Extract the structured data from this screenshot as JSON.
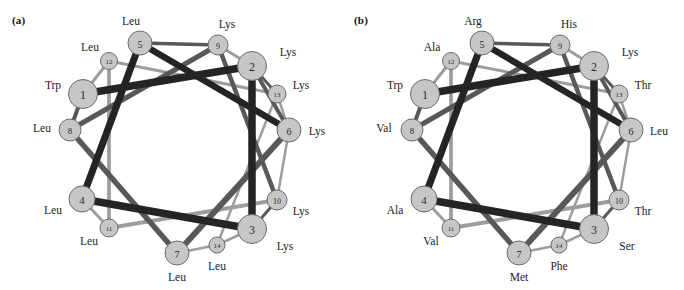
{
  "figure": {
    "type": "helical-wheel-diagram",
    "panels": [
      {
        "id": "a",
        "label": "(a)",
        "label_x": 12,
        "label_y": 14,
        "residues": [
          {
            "num": "1",
            "aa": "Trp",
            "cx": 83,
            "cy": 94,
            "r": 14.5,
            "lx": 53,
            "ly": 85
          },
          {
            "num": "2",
            "aa": "Lys",
            "cx": 252,
            "cy": 66,
            "r": 14.5,
            "lx": 288,
            "ly": 52
          },
          {
            "num": "3",
            "aa": "Lys",
            "cx": 252,
            "cy": 229,
            "r": 14.5,
            "lx": 285,
            "ly": 246
          },
          {
            "num": "4",
            "aa": "Leu",
            "cx": 82,
            "cy": 199,
            "r": 13.0,
            "lx": 53,
            "ly": 210
          },
          {
            "num": "5",
            "aa": "Leu",
            "cx": 140,
            "cy": 43,
            "r": 12.0,
            "lx": 131,
            "ly": 21
          },
          {
            "num": "6",
            "aa": "Lys",
            "cx": 289,
            "cy": 130,
            "r": 12.0,
            "lx": 317,
            "ly": 131
          },
          {
            "num": "7",
            "aa": "Leu",
            "cx": 177,
            "cy": 253,
            "r": 12.0,
            "lx": 177,
            "ly": 277
          },
          {
            "num": "8",
            "aa": "Leu",
            "cx": 70,
            "cy": 130,
            "r": 11.0,
            "lx": 42,
            "ly": 128
          },
          {
            "num": "9",
            "aa": "Lys",
            "cx": 218,
            "cy": 45,
            "r": 10.0,
            "lx": 227,
            "ly": 24
          },
          {
            "num": "10",
            "aa": "Lys",
            "cx": 277,
            "cy": 200,
            "r": 10.0,
            "lx": 301,
            "ly": 211
          },
          {
            "num": "11",
            "aa": "Leu",
            "cx": 109,
            "cy": 228,
            "r": 9.0,
            "lx": 89,
            "ly": 241
          },
          {
            "num": "12",
            "aa": "Leu",
            "cx": 109,
            "cy": 61,
            "r": 8.5,
            "lx": 90,
            "ly": 47
          },
          {
            "num": "13",
            "aa": "Lys",
            "cx": 277,
            "cy": 94,
            "r": 9.0,
            "lx": 301,
            "ly": 85
          },
          {
            "num": "14",
            "aa": "Leu",
            "cx": 217,
            "cy": 245,
            "r": 8.0,
            "lx": 217,
            "ly": 266
          }
        ]
      },
      {
        "id": "b",
        "label": "(b)",
        "label_x": 12,
        "label_y": 14,
        "residues": [
          {
            "num": "1",
            "aa": "Trp",
            "cx": 83,
            "cy": 94,
            "r": 14.5,
            "lx": 53,
            "ly": 85
          },
          {
            "num": "2",
            "aa": "Lys",
            "cx": 252,
            "cy": 66,
            "r": 14.5,
            "lx": 288,
            "ly": 52
          },
          {
            "num": "3",
            "aa": "Ser",
            "cx": 252,
            "cy": 229,
            "r": 14.5,
            "lx": 285,
            "ly": 246
          },
          {
            "num": "4",
            "aa": "Ala",
            "cx": 82,
            "cy": 199,
            "r": 13.0,
            "lx": 53,
            "ly": 210
          },
          {
            "num": "5",
            "aa": "Arg",
            "cx": 140,
            "cy": 43,
            "r": 12.0,
            "lx": 131,
            "ly": 21
          },
          {
            "num": "6",
            "aa": "Leu",
            "cx": 289,
            "cy": 130,
            "r": 12.0,
            "lx": 317,
            "ly": 131
          },
          {
            "num": "7",
            "aa": "Met",
            "cx": 177,
            "cy": 253,
            "r": 12.0,
            "lx": 177,
            "ly": 277
          },
          {
            "num": "8",
            "aa": "Val",
            "cx": 70,
            "cy": 130,
            "r": 11.0,
            "lx": 42,
            "ly": 128
          },
          {
            "num": "9",
            "aa": "His",
            "cx": 218,
            "cy": 45,
            "r": 10.0,
            "lx": 227,
            "ly": 24
          },
          {
            "num": "10",
            "aa": "Thr",
            "cx": 277,
            "cy": 200,
            "r": 10.0,
            "lx": 301,
            "ly": 211
          },
          {
            "num": "11",
            "aa": "Val",
            "cx": 109,
            "cy": 228,
            "r": 9.0,
            "lx": 89,
            "ly": 241
          },
          {
            "num": "12",
            "aa": "Ala",
            "cx": 109,
            "cy": 61,
            "r": 8.5,
            "lx": 90,
            "ly": 47
          },
          {
            "num": "13",
            "aa": "Thr",
            "cx": 277,
            "cy": 94,
            "r": 9.0,
            "lx": 301,
            "ly": 85
          },
          {
            "num": "14",
            "aa": "Phe",
            "cx": 217,
            "cy": 245,
            "r": 8.0,
            "lx": 217,
            "ly": 266
          }
        ]
      }
    ],
    "edges": [
      {
        "from": "1",
        "to": "2",
        "tone": "dark",
        "w": 7.5
      },
      {
        "from": "2",
        "to": "3",
        "tone": "dark",
        "w": 7.5
      },
      {
        "from": "3",
        "to": "4",
        "tone": "dark",
        "w": 7.5
      },
      {
        "from": "4",
        "to": "5",
        "tone": "dark",
        "w": 7.0
      },
      {
        "from": "5",
        "to": "6",
        "tone": "dark",
        "w": 6.5
      },
      {
        "from": "6",
        "to": "7",
        "tone": "mid",
        "w": 6.0
      },
      {
        "from": "7",
        "to": "8",
        "tone": "mid",
        "w": 5.5
      },
      {
        "from": "8",
        "to": "9",
        "tone": "mid",
        "w": 5.0
      },
      {
        "from": "9",
        "to": "10",
        "tone": "mid",
        "w": 4.5
      },
      {
        "from": "10",
        "to": "11",
        "tone": "light",
        "w": 4.0
      },
      {
        "from": "11",
        "to": "12",
        "tone": "light",
        "w": 3.5
      },
      {
        "from": "12",
        "to": "13",
        "tone": "light",
        "w": 3.0
      },
      {
        "from": "13",
        "to": "14",
        "tone": "light",
        "w": 2.5
      },
      {
        "from": "2",
        "to": "13",
        "tone": "mid",
        "w": 3.0
      },
      {
        "from": "2",
        "to": "6",
        "tone": "mid",
        "w": 4.0
      },
      {
        "from": "3",
        "to": "10",
        "tone": "mid",
        "w": 3.0
      },
      {
        "from": "3",
        "to": "14",
        "tone": "light",
        "w": 2.5
      },
      {
        "from": "6",
        "to": "13",
        "tone": "light",
        "w": 2.5
      },
      {
        "from": "6",
        "to": "10",
        "tone": "light",
        "w": 2.5
      },
      {
        "from": "9",
        "to": "2",
        "tone": "light",
        "w": 3.0
      },
      {
        "from": "1",
        "to": "8",
        "tone": "mid",
        "w": 4.0
      },
      {
        "from": "12",
        "to": "11",
        "tone": "light",
        "w": 3.0
      },
      {
        "from": "5",
        "to": "9",
        "tone": "mid",
        "w": 3.5
      },
      {
        "from": "4",
        "to": "11",
        "tone": "light",
        "w": 3.0
      },
      {
        "from": "7",
        "to": "14",
        "tone": "light",
        "w": 2.5
      },
      {
        "from": "1",
        "to": "12",
        "tone": "light",
        "w": 3.0
      }
    ],
    "colors": {
      "node_fill": "#c6c6c6",
      "node_stroke": "#6b6b6b",
      "edge_dark": "#242424",
      "edge_mid": "#585858",
      "edge_light": "#9d9d9d",
      "text": "#1a1a1a",
      "background": "#ffffff"
    }
  }
}
